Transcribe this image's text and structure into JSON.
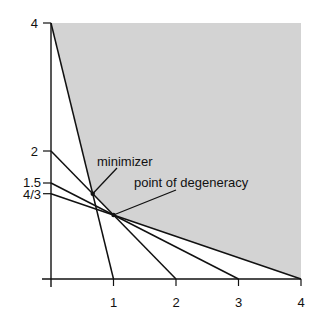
{
  "diagram": {
    "type": "linear-program-feasible-region",
    "colors": {
      "feasible_region": "#d3d3d3",
      "lines": "#111111",
      "background": "#ffffff"
    },
    "axes": {
      "x_ticks": [
        {
          "value": 1,
          "label": "1"
        },
        {
          "value": 2,
          "label": "2"
        },
        {
          "value": 3,
          "label": "3"
        },
        {
          "value": 4,
          "label": "4"
        }
      ],
      "y_ticks": [
        {
          "value": 4,
          "label": "4"
        },
        {
          "value": 2,
          "label": "2"
        },
        {
          "value": 1.5,
          "label": "1.5"
        },
        {
          "value": 1.3333,
          "label": "4/3"
        }
      ],
      "xlim": [
        0,
        4
      ],
      "ylim": [
        0,
        4
      ]
    },
    "constraint_lines": [
      {
        "from": [
          0,
          4
        ],
        "to": [
          1,
          0
        ]
      },
      {
        "from": [
          0,
          2
        ],
        "to": [
          2,
          0
        ]
      },
      {
        "from": [
          0,
          1.5
        ],
        "to": [
          3,
          0
        ]
      },
      {
        "from": [
          0,
          1.3333
        ],
        "to": [
          4,
          0
        ]
      }
    ],
    "feasible_region_vertices": [
      [
        0,
        4
      ],
      [
        0.6667,
        1.3333
      ],
      [
        1,
        1
      ],
      [
        4,
        0
      ],
      [
        4,
        4
      ]
    ],
    "points": {
      "minimizer": {
        "x": 0.6667,
        "y": 1.3333,
        "label": "minimizer"
      },
      "degeneracy": {
        "x": 1,
        "y": 1,
        "label": "point of degeneracy"
      }
    }
  }
}
